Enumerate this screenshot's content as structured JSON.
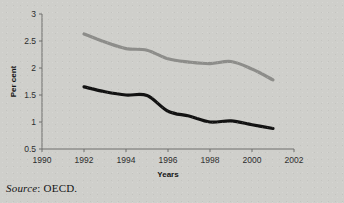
{
  "figure": {
    "source_prefix": "Source",
    "source_sep": ": ",
    "source_value": "OECD.",
    "clipped_header": ""
  },
  "chart_data": {
    "type": "line",
    "title": "",
    "xlabel": "Years",
    "ylabel": "Per cent",
    "xlim": [
      1990,
      2002
    ],
    "ylim": [
      0.5,
      3
    ],
    "xticks": [
      "1990",
      "1992",
      "1994",
      "1996",
      "1998",
      "2000",
      "2002"
    ],
    "xtick_values": [
      1990,
      1992,
      1994,
      1996,
      1998,
      2000,
      2002
    ],
    "yticks": [
      "0.5",
      "1",
      "1.5",
      "2",
      "2.5",
      "3"
    ],
    "ytick_values": [
      0.5,
      1,
      1.5,
      2,
      2.5,
      3
    ],
    "grid": false,
    "legend": "none",
    "x": [
      1992,
      1993,
      1994,
      1995,
      1996,
      1997,
      1998,
      1999,
      2000,
      2001
    ],
    "series": [
      {
        "name": "upper-series",
        "color": "#8d8d8a",
        "width": 3.2,
        "values": [
          2.63,
          2.48,
          2.36,
          2.33,
          2.17,
          2.11,
          2.08,
          2.12,
          1.98,
          1.78
        ]
      },
      {
        "name": "lower-series",
        "color": "#121212",
        "width": 3.2,
        "values": [
          1.65,
          1.56,
          1.5,
          1.49,
          1.2,
          1.11,
          1.0,
          1.02,
          0.95,
          0.88
        ]
      }
    ],
    "axis_color": "#6f6f6c",
    "plot_area": {
      "left": 42,
      "right": 294,
      "top": 14,
      "bottom": 149
    }
  }
}
